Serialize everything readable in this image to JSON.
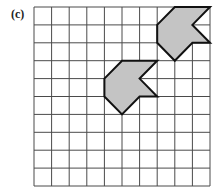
{
  "figure": {
    "label": "(c)",
    "grid": {
      "cols": 10,
      "rows": 10,
      "origin_px": [
        34,
        7
      ],
      "cell_w": 17.6,
      "cell_h": 17.9,
      "line_color": "#4a4a4a"
    },
    "shapes": [
      {
        "name": "original-shape",
        "vertices": [
          [
            5,
            3
          ],
          [
            7,
            3
          ],
          [
            6,
            4
          ],
          [
            7,
            5
          ],
          [
            6,
            5
          ],
          [
            5,
            6
          ],
          [
            4,
            5
          ],
          [
            4,
            4
          ]
        ],
        "fill": "#c4c4c4",
        "stroke": "#111111"
      },
      {
        "name": "translated-shape",
        "vertices": [
          [
            8,
            0
          ],
          [
            10,
            0
          ],
          [
            9,
            1
          ],
          [
            10,
            2
          ],
          [
            9,
            2
          ],
          [
            8,
            3
          ],
          [
            7,
            2
          ],
          [
            7,
            1
          ]
        ],
        "fill": "#c4c4c4",
        "stroke": "#111111"
      }
    ]
  }
}
